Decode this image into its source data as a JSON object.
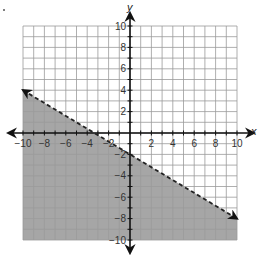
{
  "chart_data": {
    "type": "inequality-graph",
    "title": "",
    "xlabel": "x",
    "ylabel": "y",
    "xlim": [
      -10,
      10
    ],
    "ylim": [
      -10,
      10
    ],
    "grid": true,
    "grid_step": 1,
    "x_ticks": [
      -10,
      -8,
      -6,
      -4,
      -2,
      2,
      4,
      6,
      8,
      10
    ],
    "y_ticks": [
      10,
      8,
      6,
      4,
      2,
      -2,
      -4,
      -6,
      -8,
      -10
    ],
    "x_tick_labels": [
      "−10",
      "−8",
      "−6",
      "−4",
      "−2",
      "2",
      "4",
      "6",
      "8",
      "10"
    ],
    "y_tick_labels": [
      "10",
      "8",
      "6",
      "4",
      "2",
      "−2",
      "−4",
      "−6",
      "−8",
      "−10"
    ],
    "boundary_line": {
      "style": "dashed",
      "slope": -0.6,
      "y_intercept": -2,
      "equation": "y = -0.6x - 2",
      "points": [
        [
          -10,
          4
        ],
        [
          10,
          -8
        ]
      ],
      "arrows_at_ends": true
    },
    "shaded_region": "below",
    "inequality": "y < -0.6x - 2",
    "colors": {
      "shade": "#a6a6a6",
      "grid": "#9a9a9a",
      "axes": "#111111",
      "boundary": "#222222"
    }
  },
  "labels": {
    "x_axis": "x",
    "y_axis": "y"
  }
}
